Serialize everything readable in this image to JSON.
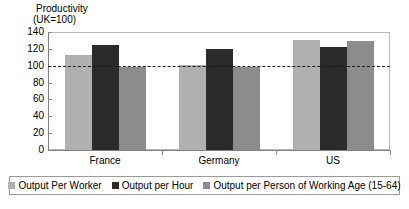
{
  "chart_data": {
    "type": "bar",
    "title": "Productivity",
    "subtitle": "(UK=100)",
    "xlabel": "",
    "ylabel": "",
    "ylim": [
      0,
      140
    ],
    "yticks": [
      0,
      20,
      40,
      60,
      80,
      100,
      120,
      140
    ],
    "grid": false,
    "legend_position": "bottom",
    "reference_line": {
      "value": 100,
      "style": "dashed",
      "label": "UK=100"
    },
    "categories": [
      "France",
      "Germany",
      "US"
    ],
    "series": [
      {
        "name": "Output Per Worker",
        "color": "#b0b0b0",
        "values": [
          113,
          101,
          130
        ]
      },
      {
        "name": "Output per Hour",
        "color": "#2b2b2b",
        "values": [
          125,
          120,
          122
        ]
      },
      {
        "name": "Output per Person of Working Age (15-64)",
        "color": "#8c8c8c",
        "values": [
          99,
          98,
          129
        ]
      }
    ]
  },
  "axis": {
    "y_tick_labels": [
      "140",
      "120",
      "100",
      "80",
      "60",
      "40",
      "20",
      "0"
    ]
  }
}
